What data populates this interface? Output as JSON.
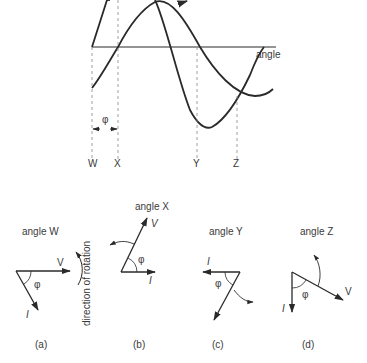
{
  "waveform": {
    "axis_label": "angle",
    "phase_label": "φ",
    "markers": [
      "W",
      "X",
      "Y",
      "Z"
    ]
  },
  "phasors": [
    {
      "title": "angle W",
      "caption": "(a)",
      "v_label": "V",
      "i_label": "I",
      "phi_label": "φ"
    },
    {
      "title": "angle X",
      "caption": "(b)",
      "v_label": "V",
      "i_label": "I",
      "phi_label": "φ"
    },
    {
      "title": "angle Y",
      "caption": "(c)",
      "v_label": "",
      "i_label": "I",
      "phi_label": "φ"
    },
    {
      "title": "angle Z",
      "caption": "(d)",
      "v_label": "V",
      "i_label": "I",
      "phi_label": "φ"
    }
  ],
  "rotation_label": "direction of rotation",
  "colors": {
    "ink": "#2a2a2a",
    "dashed": "#888888"
  }
}
